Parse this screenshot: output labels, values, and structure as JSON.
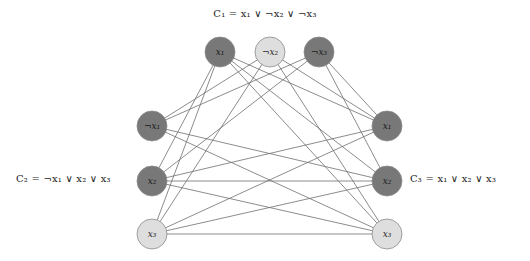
{
  "figure": {
    "background_color": "#ffffff",
    "width": 530,
    "height": 261
  },
  "colors": {
    "node_dark": "#787878",
    "node_light": "#dedede",
    "node_stroke": "#8a8a8a",
    "edge": "#6e6e6e",
    "text": "#1c1c1c"
  },
  "clause_labels": {
    "c1": "C₁ = x₁ ∨ ¬x₂ ∨ ¬x₃",
    "c2": "C₂ = ¬x₁ ∨ x₂ ∨ x₃",
    "c3": "C₃ = x₁ ∨ x₂ ∨ x₃"
  },
  "chart_data": {
    "type": "diagram",
    "nodes": [
      {
        "id": "c1l1",
        "label": "x₁",
        "var": "x1",
        "negated": false,
        "clause": "C1",
        "shade": "dark",
        "cx": 220,
        "cy": 52
      },
      {
        "id": "c1l2",
        "label": "¬x₂",
        "var": "x2",
        "negated": true,
        "clause": "C1",
        "shade": "light",
        "cx": 270,
        "cy": 52
      },
      {
        "id": "c1l3",
        "label": "¬x₃",
        "var": "x3",
        "negated": true,
        "clause": "C1",
        "shade": "dark",
        "cx": 319,
        "cy": 52
      },
      {
        "id": "c2l1",
        "label": "¬x₁",
        "var": "x1",
        "negated": true,
        "clause": "C2",
        "shade": "dark",
        "cx": 152,
        "cy": 126
      },
      {
        "id": "c2l2",
        "label": "x₂",
        "var": "x2",
        "negated": false,
        "clause": "C2",
        "shade": "dark",
        "cx": 152,
        "cy": 181
      },
      {
        "id": "c2l3",
        "label": "x₃",
        "var": "x3",
        "negated": false,
        "clause": "C2",
        "shade": "light",
        "cx": 152,
        "cy": 234
      },
      {
        "id": "c3l1",
        "label": "x₁",
        "var": "x1",
        "negated": false,
        "clause": "C3",
        "shade": "dark",
        "cx": 387,
        "cy": 126
      },
      {
        "id": "c3l2",
        "label": "x₂",
        "var": "x2",
        "negated": false,
        "clause": "C3",
        "shade": "dark",
        "cx": 387,
        "cy": 181
      },
      {
        "id": "c3l3",
        "label": "x₃",
        "var": "x3",
        "negated": false,
        "clause": "C3",
        "shade": "light",
        "cx": 387,
        "cy": 234
      }
    ],
    "node_radius": 15,
    "edges": [
      [
        "c1l1",
        "c2l2"
      ],
      [
        "c1l1",
        "c2l3"
      ],
      [
        "c1l1",
        "c3l1"
      ],
      [
        "c1l1",
        "c3l2"
      ],
      [
        "c1l1",
        "c3l3"
      ],
      [
        "c1l2",
        "c2l1"
      ],
      [
        "c1l2",
        "c2l3"
      ],
      [
        "c1l2",
        "c3l1"
      ],
      [
        "c1l2",
        "c3l3"
      ],
      [
        "c1l3",
        "c2l1"
      ],
      [
        "c1l3",
        "c2l2"
      ],
      [
        "c1l3",
        "c3l1"
      ],
      [
        "c1l3",
        "c3l2"
      ],
      [
        "c2l1",
        "c3l2"
      ],
      [
        "c2l1",
        "c3l3"
      ],
      [
        "c2l2",
        "c3l1"
      ],
      [
        "c2l2",
        "c3l2"
      ],
      [
        "c2l2",
        "c3l3"
      ],
      [
        "c2l3",
        "c3l1"
      ],
      [
        "c2l3",
        "c3l2"
      ],
      [
        "c2l3",
        "c3l3"
      ]
    ]
  }
}
